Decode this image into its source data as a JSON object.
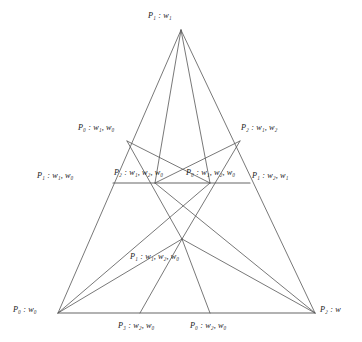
{
  "figure": {
    "type": "diagram",
    "background_color": "#ffffff",
    "line_color": "#555555",
    "text_color": "#1a1a1a"
  },
  "labels": {
    "apex": "P₁ : w₁",
    "upper_left": "P₀ : w₁, w₀",
    "upper_right": "P₂ : w₁, w₂",
    "mid_left_outer": "P₁ : w₁, w₀",
    "mid_left_inner": "P₂ : w₁, w₂, w₀",
    "mid_right_inner": "P₀ : w₁, w₂, w₀",
    "mid_right_outer": "P₁ : w₂, w₁",
    "center": "P₁ : w₁, w₂, w₀",
    "bottom_left": "P₀ : w₀",
    "bottom_right": "P₂ : w",
    "bottom_mid_left": "P₃ : w₂, w₀",
    "bottom_mid_right": "P₀ : w₂, w₀"
  },
  "nodes": {
    "apex": {
      "x": 181,
      "y": 30
    },
    "bottom_left": {
      "x": 58,
      "y": 313
    },
    "bottom_right": {
      "x": 315,
      "y": 313
    },
    "upper_left": {
      "x": 127,
      "y": 141
    },
    "upper_right": {
      "x": 240,
      "y": 141
    },
    "mid_left": {
      "x": 113,
      "y": 183
    },
    "mid_node_left": {
      "x": 155,
      "y": 183
    },
    "mid_node_right": {
      "x": 210,
      "y": 183
    },
    "mid_right": {
      "x": 250,
      "y": 183
    },
    "center": {
      "x": 182,
      "y": 239
    },
    "base_left": {
      "x": 140,
      "y": 313
    },
    "base_right": {
      "x": 210,
      "y": 313
    }
  }
}
